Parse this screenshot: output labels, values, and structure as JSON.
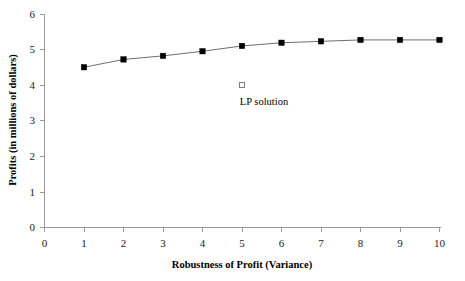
{
  "chart_data": {
    "type": "line",
    "title": "",
    "xlabel": "Robustness of Profit (Variance)",
    "ylabel": "Profits (in millions of dollars)",
    "x": [
      1,
      2,
      3,
      4,
      5,
      6,
      7,
      8,
      9,
      10
    ],
    "values": [
      4.5,
      4.72,
      4.82,
      4.95,
      5.1,
      5.19,
      5.23,
      5.27,
      5.27,
      5.27
    ],
    "series": [
      {
        "name": "Profit frontier",
        "marker": "filled-square",
        "values": [
          4.5,
          4.72,
          4.82,
          4.95,
          5.1,
          5.19,
          5.23,
          5.27,
          5.27,
          5.27
        ]
      }
    ],
    "annotations": [
      {
        "label": "LP solution",
        "x": 5,
        "y": 4.0,
        "marker": "hollow-square"
      }
    ],
    "xlim": [
      0,
      10
    ],
    "ylim": [
      0,
      6
    ],
    "xticks": [
      "0",
      "1",
      "2",
      "3",
      "4",
      "5",
      "6",
      "7",
      "8",
      "9",
      "10"
    ],
    "yticks": [
      "0",
      "1",
      "2",
      "3",
      "4",
      "5",
      "6"
    ],
    "grid": false,
    "legend": "none",
    "colors": {
      "line": "#6e6e6e",
      "marker": "#000000",
      "axis": "#9a9a9a",
      "background": "#ffffff",
      "text": "#000000"
    }
  }
}
